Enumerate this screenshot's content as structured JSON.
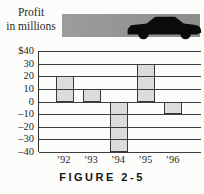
{
  "header": {
    "title_line1": "Profit",
    "title_line2": "in millions",
    "band_color": "#949794",
    "car_color": "#0b0b0b"
  },
  "figure_caption": "FIGURE 2-5",
  "chart_data": {
    "type": "bar",
    "title": "Profit in millions",
    "categories": [
      "’92",
      "’93",
      "’94",
      "’95",
      "’96"
    ],
    "values": [
      20,
      10,
      -40,
      30,
      -10
    ],
    "xlabel": "",
    "ylabel": "",
    "ylim": [
      -40,
      40
    ],
    "ytick_step": 10,
    "ytick_labels": [
      "$40",
      "30",
      "20",
      "10",
      "0",
      "–10",
      "–20",
      "–30",
      "–40"
    ],
    "grid": "horizontal",
    "legend": "none",
    "bar_fill": "#dcdcda",
    "bar_border": "#3a3a3a",
    "axis_color": "#2e2e2e"
  }
}
